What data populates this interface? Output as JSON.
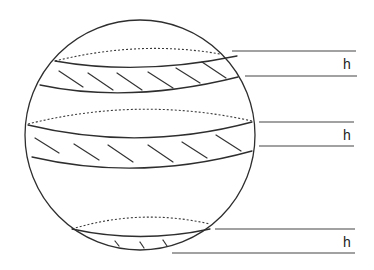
{
  "figure": {
    "colors": {
      "stroke": "#2e2e2e",
      "background": "#ffffff"
    },
    "sphere": {
      "cx": 140,
      "cy": 135,
      "r": 116
    },
    "zones": [
      {
        "name": "upper-zone",
        "label": "h",
        "label_pos": {
          "x": 343,
          "y": 57
        },
        "h_lines": [
          {
            "x1": 232,
            "x2": 356,
            "y": 51
          },
          {
            "x1": 245,
            "x2": 357,
            "y": 76
          }
        ]
      },
      {
        "name": "middle-zone",
        "label": "h",
        "label_pos": {
          "x": 343,
          "y": 128
        },
        "h_lines": [
          {
            "x1": 259,
            "x2": 354,
            "y": 122
          },
          {
            "x1": 259,
            "x2": 354,
            "y": 146
          }
        ]
      },
      {
        "name": "lower-zone",
        "label": "h",
        "label_pos": {
          "x": 343,
          "y": 235
        },
        "h_lines": [
          {
            "x1": 215,
            "x2": 355,
            "y": 229
          },
          {
            "x1": 172,
            "x2": 355,
            "y": 253
          }
        ]
      }
    ]
  }
}
